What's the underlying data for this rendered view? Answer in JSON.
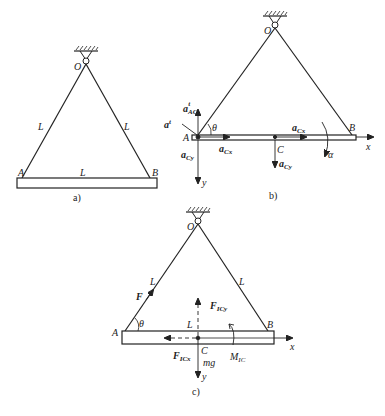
{
  "figure_a": {
    "caption": "a)",
    "pivot": "O",
    "end_left": "A",
    "end_right": "B",
    "rope_left_length": "L",
    "rope_right_length": "L",
    "bar_length": "L"
  },
  "figure_b": {
    "caption": "b)",
    "pivot": "O",
    "end_left": "A",
    "end_right": "B",
    "center": "C",
    "angle": "θ",
    "angular_accel": "α",
    "axis_x": "x",
    "axis_y": "y",
    "vec_a": "a",
    "accel_AC_tangential_sub": "AC",
    "accel_AC_tangential_sup": "t",
    "accel_A_normal_sup": "t",
    "accel_Cx_sub": "Cx",
    "accel_Cy_sub": "Cy"
  },
  "figure_c": {
    "caption": "c)",
    "pivot": "O",
    "end_left": "A",
    "end_right": "B",
    "center": "C",
    "angle": "θ",
    "rope_left_length": "L",
    "rope_right_length": "L",
    "bar_half": "L",
    "tension": "F",
    "inertia_force_letter": "F",
    "inertia_Cy_sub": "ICy",
    "inertia_Cx_sub": "ICx",
    "inertia_moment_letter": "M",
    "inertia_moment_sub": "IC",
    "weight": "mg",
    "axis_x": "x",
    "axis_y": "y"
  },
  "colors": {
    "ink": "#222222",
    "background": "#ffffff"
  }
}
